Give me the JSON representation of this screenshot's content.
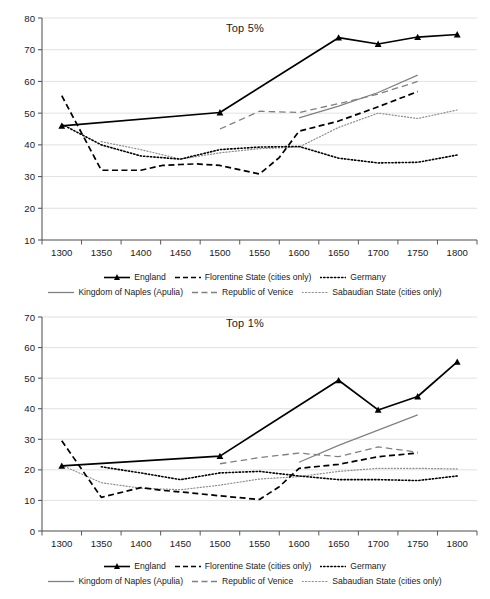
{
  "figure": {
    "width": 490,
    "height": 599,
    "background": "#ffffff",
    "ink": "#1a1a1a",
    "gridline_color": "#d9d9d9",
    "axis_color": "#595959",
    "gray_series_color": "#808080"
  },
  "legend": {
    "row1": [
      {
        "name": "England",
        "style": "solid-marker",
        "color": "#000000"
      },
      {
        "name": "Florentine State (cities only)",
        "style": "dashed-heavy",
        "color": "#000000"
      },
      {
        "name": "Germany",
        "style": "dotted-heavy",
        "color": "#000000"
      }
    ],
    "row2": [
      {
        "name": "Kingdom of Naples (Apulia)",
        "style": "solid-thin",
        "color": "#808080"
      },
      {
        "name": "Republic of Venice",
        "style": "dashed-gray",
        "color": "#808080"
      },
      {
        "name": "Sabaudian State (cities only)",
        "style": "dotted-light",
        "color": "#8c8c8c"
      }
    ]
  },
  "chart_data": [
    {
      "id": "top5",
      "type": "line",
      "title": "Top 5%",
      "xlabel": "",
      "ylabel": "",
      "xlim": [
        1275,
        1825
      ],
      "ylim": [
        10,
        80
      ],
      "ytick_step": 10,
      "grid": true,
      "legend_position": "bottom",
      "categories": [
        1300,
        1350,
        1400,
        1450,
        1500,
        1550,
        1600,
        1650,
        1700,
        1750,
        1800
      ],
      "xticks": [
        "1300",
        "1350",
        "1400",
        "1450",
        "1500",
        "1550",
        "1600",
        "1650",
        "1700",
        "1750",
        "1800"
      ],
      "yticks": [
        "10",
        "20",
        "30",
        "40",
        "50",
        "60",
        "70",
        "80"
      ],
      "series": [
        {
          "name": "England",
          "style": "solid-marker",
          "color": "#000000",
          "x": [
            1300,
            1500,
            1650,
            1700,
            1750,
            1800
          ],
          "values": [
            46.0,
            50.2,
            73.8,
            71.8,
            74.0,
            74.8
          ]
        },
        {
          "name": "Florentine State (cities only)",
          "style": "dashed-heavy",
          "color": "#000000",
          "x": [
            1300,
            1350,
            1400,
            1427,
            1450,
            1470,
            1500,
            1550,
            1575,
            1600,
            1650,
            1700,
            1750
          ],
          "values": [
            55.5,
            32.0,
            32.0,
            33.5,
            33.8,
            34.0,
            33.5,
            30.8,
            36.0,
            44.3,
            47.5,
            52.0,
            56.8
          ]
        },
        {
          "name": "Germany",
          "style": "dotted-heavy",
          "color": "#000000",
          "x": [
            1300,
            1350,
            1400,
            1450,
            1500,
            1550,
            1600,
            1650,
            1700,
            1750,
            1800
          ],
          "values": [
            46.5,
            40.0,
            36.5,
            35.5,
            38.5,
            39.3,
            39.5,
            35.8,
            34.3,
            34.5,
            36.8
          ]
        },
        {
          "name": "Kingdom of Naples (Apulia)",
          "style": "solid-thin",
          "color": "#808080",
          "x": [
            1600,
            1650,
            1700,
            1750
          ],
          "values": [
            48.5,
            52.2,
            56.5,
            62.0
          ]
        },
        {
          "name": "Republic of Venice",
          "style": "dashed-gray",
          "color": "#808080",
          "x": [
            1500,
            1550,
            1600,
            1650,
            1700,
            1750
          ],
          "values": [
            45.0,
            50.6,
            50.2,
            53.0,
            56.0,
            60.0
          ]
        },
        {
          "name": "Sabaudian State (cities only)",
          "style": "dotted-light",
          "color": "#8c8c8c",
          "x": [
            1350,
            1400,
            1450,
            1500,
            1550,
            1600,
            1650,
            1700,
            1750,
            1800
          ],
          "values": [
            41.0,
            38.5,
            35.5,
            37.5,
            38.8,
            39.3,
            45.5,
            50.0,
            48.3,
            51.0
          ]
        }
      ]
    },
    {
      "id": "top1",
      "type": "line",
      "title": "Top 1%",
      "xlabel": "",
      "ylabel": "",
      "xlim": [
        1275,
        1825
      ],
      "ylim": [
        0,
        70
      ],
      "ytick_step": 10,
      "grid": true,
      "legend_position": "bottom",
      "categories": [
        1300,
        1350,
        1400,
        1450,
        1500,
        1550,
        1600,
        1650,
        1700,
        1750,
        1800
      ],
      "xticks": [
        "1300",
        "1350",
        "1400",
        "1450",
        "1500",
        "1550",
        "1600",
        "1650",
        "1700",
        "1750",
        "1800"
      ],
      "yticks": [
        "0",
        "10",
        "20",
        "30",
        "40",
        "50",
        "60",
        "70"
      ],
      "series": [
        {
          "name": "England",
          "style": "solid-marker",
          "color": "#000000",
          "x": [
            1300,
            1500,
            1650,
            1700,
            1750,
            1800
          ],
          "values": [
            21.3,
            24.5,
            49.3,
            39.6,
            44.0,
            55.3
          ]
        },
        {
          "name": "Florentine State (cities only)",
          "style": "dashed-heavy",
          "color": "#000000",
          "x": [
            1300,
            1350,
            1400,
            1427,
            1450,
            1500,
            1550,
            1575,
            1600,
            1650,
            1700,
            1750
          ],
          "values": [
            29.5,
            11.0,
            14.2,
            13.3,
            12.8,
            11.5,
            10.3,
            14.5,
            20.5,
            21.8,
            24.3,
            25.5
          ]
        },
        {
          "name": "Germany",
          "style": "dotted-heavy",
          "color": "#000000",
          "x": [
            1350,
            1400,
            1450,
            1500,
            1550,
            1600,
            1650,
            1700,
            1750,
            1800
          ],
          "values": [
            21.0,
            19.0,
            16.8,
            19.0,
            19.5,
            18.0,
            16.8,
            16.8,
            16.5,
            18.0
          ]
        },
        {
          "name": "Kingdom of Naples (Apulia)",
          "style": "solid-thin",
          "color": "#808080",
          "x": [
            1600,
            1650,
            1700,
            1750
          ],
          "values": [
            22.5,
            28.0,
            33.0,
            38.0
          ]
        },
        {
          "name": "Republic of Venice",
          "style": "dashed-gray",
          "color": "#808080",
          "x": [
            1500,
            1550,
            1600,
            1650,
            1700,
            1750
          ],
          "values": [
            22.0,
            24.0,
            25.5,
            24.3,
            27.5,
            25.8
          ]
        },
        {
          "name": "Sabaudian State (cities only)",
          "style": "dotted-light",
          "color": "#8c8c8c",
          "x": [
            1300,
            1350,
            1400,
            1450,
            1500,
            1550,
            1600,
            1650,
            1700,
            1750,
            1800
          ],
          "values": [
            21.5,
            15.8,
            14.0,
            13.5,
            15.0,
            17.0,
            17.8,
            19.5,
            20.5,
            20.5,
            20.3
          ]
        }
      ]
    }
  ]
}
